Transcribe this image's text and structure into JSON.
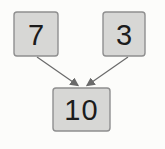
{
  "diagram": {
    "type": "addition-tree",
    "nodes": [
      {
        "id": "addend-left",
        "label": "7"
      },
      {
        "id": "addend-right",
        "label": "3"
      },
      {
        "id": "sum",
        "label": "10"
      }
    ],
    "edges": [
      {
        "from": "addend-left",
        "to": "sum"
      },
      {
        "from": "addend-right",
        "to": "sum"
      }
    ],
    "colors": {
      "background": "#fcfcfa",
      "box_fill": "#d7d7d5",
      "box_border": "#8f8f8f",
      "arrow": "#6a6a6a",
      "text": "#1c1c1c"
    }
  }
}
